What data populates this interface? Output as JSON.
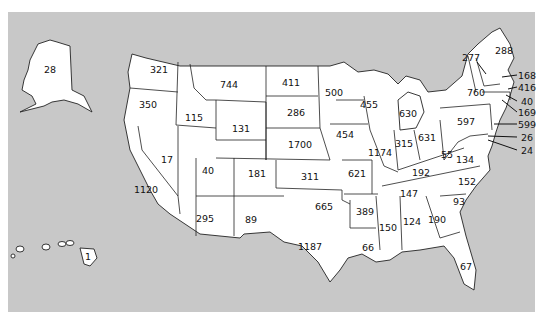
{
  "background_color": "#c8c8c8",
  "state_fill": "#ffffff",
  "chart_data": {
    "type": "choropleth-labels",
    "title": "",
    "values_by_state": [
      {
        "state": "AK",
        "value": 28,
        "x": 50,
        "y": 69
      },
      {
        "state": "HI",
        "value": 1,
        "x": 88,
        "y": 256
      },
      {
        "state": "WA",
        "value": 321,
        "x": 159,
        "y": 69
      },
      {
        "state": "OR",
        "value": 350,
        "x": 148,
        "y": 104
      },
      {
        "state": "CA",
        "value": 1120,
        "x": 146,
        "y": 189
      },
      {
        "state": "NV",
        "value": 17,
        "x": 167,
        "y": 159
      },
      {
        "state": "ID",
        "value": 115,
        "x": 194,
        "y": 117
      },
      {
        "state": "MT",
        "value": 744,
        "x": 229,
        "y": 84
      },
      {
        "state": "WY",
        "value": 131,
        "x": 241,
        "y": 128
      },
      {
        "state": "UT",
        "value": 40,
        "x": 208,
        "y": 170
      },
      {
        "state": "AZ",
        "value": 295,
        "x": 205,
        "y": 218
      },
      {
        "state": "CO",
        "value": 181,
        "x": 257,
        "y": 173
      },
      {
        "state": "NM",
        "value": 89,
        "x": 251,
        "y": 219
      },
      {
        "state": "ND",
        "value": 411,
        "x": 291,
        "y": 82
      },
      {
        "state": "SD",
        "value": 286,
        "x": 296,
        "y": 112
      },
      {
        "state": "NE",
        "value": 1700,
        "x": 300,
        "y": 144
      },
      {
        "state": "KS",
        "value": 311,
        "x": 310,
        "y": 176
      },
      {
        "state": "OK",
        "value": 665,
        "x": 324,
        "y": 206
      },
      {
        "state": "TX",
        "value": 1187,
        "x": 310,
        "y": 246
      },
      {
        "state": "MN",
        "value": 500,
        "x": 334,
        "y": 92
      },
      {
        "state": "IA",
        "value": 454,
        "x": 345,
        "y": 134
      },
      {
        "state": "MO",
        "value": 621,
        "x": 357,
        "y": 173
      },
      {
        "state": "AR",
        "value": 389,
        "x": 365,
        "y": 211
      },
      {
        "state": "LA",
        "value": 66,
        "x": 368,
        "y": 247
      },
      {
        "state": "WI",
        "value": 455,
        "x": 369,
        "y": 104
      },
      {
        "state": "IL",
        "value": 1174,
        "x": 380,
        "y": 152
      },
      {
        "state": "MI",
        "value": 630,
        "x": 408,
        "y": 113
      },
      {
        "state": "IN",
        "value": 315,
        "x": 404,
        "y": 143
      },
      {
        "state": "OH",
        "value": 631,
        "x": 427,
        "y": 137
      },
      {
        "state": "KY",
        "value": 192,
        "x": 421,
        "y": 172
      },
      {
        "state": "TN",
        "value": 147,
        "x": 409,
        "y": 193
      },
      {
        "state": "MS",
        "value": 150,
        "x": 388,
        "y": 227
      },
      {
        "state": "AL",
        "value": 124,
        "x": 412,
        "y": 221
      },
      {
        "state": "GA",
        "value": 190,
        "x": 437,
        "y": 219
      },
      {
        "state": "FL",
        "value": 67,
        "x": 466,
        "y": 266
      },
      {
        "state": "SC",
        "value": 93,
        "x": 459,
        "y": 201
      },
      {
        "state": "NC",
        "value": 152,
        "x": 467,
        "y": 181
      },
      {
        "state": "VA",
        "value": 134,
        "x": 465,
        "y": 159
      },
      {
        "state": "WV",
        "value": 55,
        "x": 447,
        "y": 154
      },
      {
        "state": "PA",
        "value": 597,
        "x": 466,
        "y": 121
      },
      {
        "state": "NY",
        "value": 760,
        "x": 476,
        "y": 92
      },
      {
        "state": "VT",
        "value": 277,
        "x": 471,
        "y": 57
      },
      {
        "state": "ME",
        "value": 288,
        "x": 504,
        "y": 50
      },
      {
        "state": "NH",
        "value": 168,
        "x": 527,
        "y": 75
      },
      {
        "state": "MA",
        "value": 416,
        "x": 527,
        "y": 87
      },
      {
        "state": "RI",
        "value": 40,
        "x": 527,
        "y": 101
      },
      {
        "state": "CT",
        "value": 169,
        "x": 527,
        "y": 112
      },
      {
        "state": "NJ",
        "value": 599,
        "x": 527,
        "y": 124
      },
      {
        "state": "DE",
        "value": 26,
        "x": 527,
        "y": 137
      },
      {
        "state": "MD",
        "value": 24,
        "x": 527,
        "y": 150
      }
    ]
  }
}
